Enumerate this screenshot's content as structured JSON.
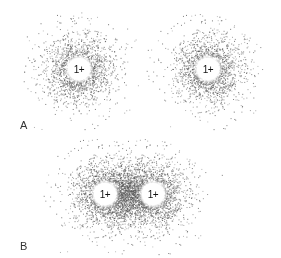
{
  "figure": {
    "panels": [
      {
        "label": "A",
        "label_pos": [
          20,
          119
        ],
        "description": "Two separate hydrogen atoms, each with spherical electron cloud",
        "nuclei": [
          {
            "charge": "1+",
            "x": 79,
            "y": 69,
            "cloud_radius": 48
          },
          {
            "charge": "1+",
            "x": 208,
            "y": 69,
            "cloud_radius": 48
          }
        ]
      },
      {
        "label": "B",
        "label_pos": [
          20,
          240
        ],
        "description": "Hydrogen molecule, shared electron cloud around both nuclei",
        "nuclei": [
          {
            "charge": "1+",
            "x": 105,
            "y": 194,
            "cloud_radius": 48
          },
          {
            "charge": "1+",
            "x": 153,
            "y": 194,
            "cloud_radius": 48
          }
        ]
      }
    ],
    "dot_color": "#555555"
  }
}
